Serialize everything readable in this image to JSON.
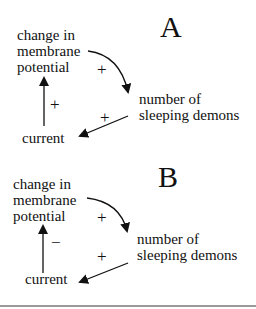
{
  "panels": [
    {
      "letter": "A",
      "nodes": {
        "membrane_potential": [
          "change in",
          "membrane",
          "potential"
        ],
        "demons": [
          "number of",
          "sleeping demons"
        ],
        "current": "current"
      },
      "edges": {
        "potential_to_demons": "+",
        "demons_to_current": "+",
        "current_to_potential": "+"
      }
    },
    {
      "letter": "B",
      "nodes": {
        "membrane_potential": [
          "change in",
          "membrane",
          "potential"
        ],
        "demons": [
          "number of",
          "sleeping demons"
        ],
        "current": "current"
      },
      "edges": {
        "potential_to_demons": "+",
        "demons_to_current": "+",
        "current_to_potential": "−"
      }
    }
  ]
}
